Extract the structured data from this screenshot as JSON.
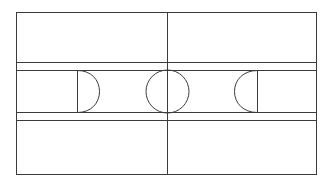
{
  "diagram": {
    "type": "sports-field-diagram",
    "sport": "soccer",
    "background_color": "#ffffff",
    "line_color": "#3b3b3b",
    "line_width": 1,
    "canvas": {
      "width": 333,
      "height": 187
    },
    "geometry": {
      "pitch_outline": {
        "x": 16,
        "y": 12,
        "width": 301,
        "height": 163
      },
      "halfway_line": {
        "x": 167,
        "y1": 12,
        "y2": 175
      },
      "center_circle": {
        "cx": 167,
        "cy": 91,
        "r": 21.5
      },
      "upper_band": {
        "y_top": 62,
        "y_bottom": 70
      },
      "lower_band": {
        "y_top": 112,
        "y_bottom": 120
      },
      "left_area": {
        "x_start": 16,
        "x_straight": 77,
        "x_arc_tip": 99,
        "y_top": 70,
        "y_bottom": 112
      },
      "right_area": {
        "x_start": 317,
        "x_straight": 257,
        "x_arc_tip": 234,
        "y_top": 70,
        "y_bottom": 112
      }
    },
    "elements": {
      "pitch_outline_label": "pitch-outline",
      "halfway_line_label": "halfway-line",
      "center_circle_label": "center-circle",
      "left_penalty_area_label": "left-penalty-area",
      "right_penalty_area_label": "right-penalty-area",
      "left_arc_label": "left-penalty-arc",
      "right_arc_label": "right-penalty-arc",
      "upper_touch_band_label": "upper-horizontal-band",
      "lower_touch_band_label": "lower-horizontal-band"
    }
  }
}
